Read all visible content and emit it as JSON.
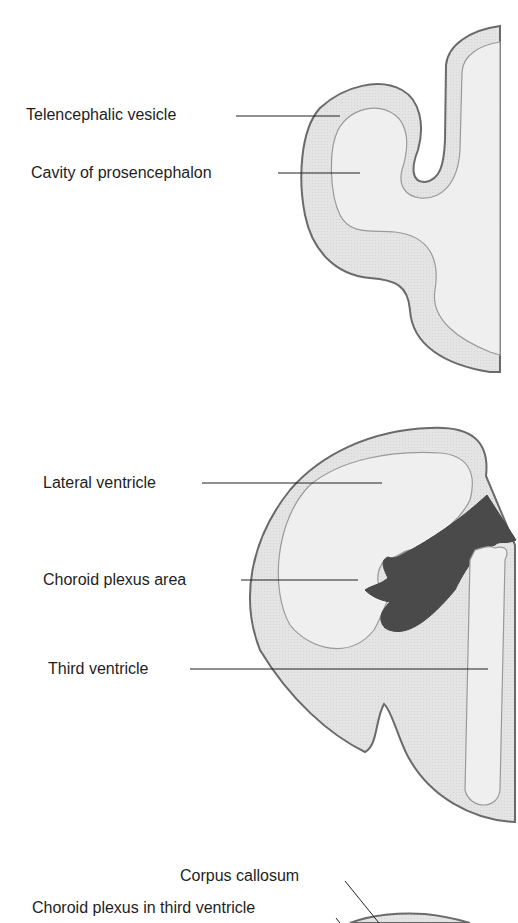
{
  "colors": {
    "tissue_fill": "#e2e2e2",
    "cavity_fill": "#eeeeee",
    "outline": "#6a6a6a",
    "inner_outline": "#9a9a9a",
    "choroid_dark": "#4a4a4a",
    "leader": "#222222"
  },
  "panels": [
    {
      "id": "panel-a",
      "labels": [
        {
          "text": "Telencephalic vesicle"
        },
        {
          "text": "Cavity of prosencephalon"
        }
      ]
    },
    {
      "id": "panel-b",
      "labels": [
        {
          "text": "Lateral ventricle"
        },
        {
          "text": "Choroid plexus area"
        },
        {
          "text": "Third ventricle"
        }
      ]
    },
    {
      "id": "panel-c",
      "labels": [
        {
          "text": "Corpus callosum"
        },
        {
          "text": "Choroid plexus in third ventricle"
        }
      ]
    }
  ]
}
